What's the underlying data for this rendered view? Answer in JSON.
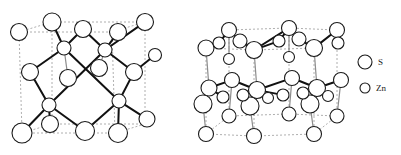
{
  "figure": {
    "background_color": "#ffffff",
    "width": 401,
    "height": 155
  },
  "style": {
    "atom_stroke": "#1a1a1a",
    "atom_fill": "#ffffff",
    "bond_color": "#111111",
    "cell_edge_color": "#9a9a9a",
    "bond_light_color": "#8d8d8d",
    "text_color": "#1a1a1a",
    "atom_stroke_width": 1.1,
    "bond_width": 2.0,
    "cell_dash": "2,2"
  },
  "structures": [
    {
      "name": "zinc-blende",
      "label": "",
      "lattice": "cubic",
      "cell_nodes": [
        {
          "id": "c-tfl",
          "x": 52,
          "y": 22
        },
        {
          "id": "c-tfr",
          "x": 145,
          "y": 22
        },
        {
          "id": "c-tbl",
          "x": 19,
          "y": 32
        },
        {
          "id": "c-tbr",
          "x": 112,
          "y": 32
        },
        {
          "id": "c-bfl",
          "x": 52,
          "y": 124
        },
        {
          "id": "c-bfr",
          "x": 145,
          "y": 124
        },
        {
          "id": "c-bbl",
          "x": 22,
          "y": 133
        },
        {
          "id": "c-bbr",
          "x": 115,
          "y": 133
        }
      ],
      "cell_edges": [
        [
          "c-tfl",
          "c-tfr"
        ],
        [
          "c-tfr",
          "c-tbr"
        ],
        [
          "c-tbr",
          "c-tbl"
        ],
        [
          "c-tbl",
          "c-tfl"
        ],
        [
          "c-bfl",
          "c-bfr"
        ],
        [
          "c-bfr",
          "c-bbr"
        ],
        [
          "c-bbr",
          "c-bbl"
        ],
        [
          "c-bbl",
          "c-bfl"
        ],
        [
          "c-tfl",
          "c-bfl"
        ],
        [
          "c-tfr",
          "c-bfr"
        ],
        [
          "c-tbl",
          "c-bbl"
        ],
        [
          "c-tbr",
          "c-bbr"
        ]
      ],
      "atoms": [
        {
          "id": "S1",
          "x": 19,
          "y": 32,
          "r": 8.5,
          "element": "S"
        },
        {
          "id": "S2",
          "x": 52,
          "y": 22,
          "r": 9.0,
          "element": "S"
        },
        {
          "id": "S3",
          "x": 145,
          "y": 22,
          "r": 8.5,
          "element": "S"
        },
        {
          "id": "S4",
          "x": 83,
          "y": 29,
          "r": 8.5,
          "element": "S"
        },
        {
          "id": "S5",
          "x": 118,
          "y": 32,
          "r": 8.5,
          "element": "S"
        },
        {
          "id": "S6",
          "x": 30,
          "y": 72,
          "r": 8.5,
          "element": "S"
        },
        {
          "id": "S7",
          "x": 68,
          "y": 78,
          "r": 8.5,
          "element": "S"
        },
        {
          "id": "S8",
          "x": 99,
          "y": 68,
          "r": 8.5,
          "element": "S"
        },
        {
          "id": "S9",
          "x": 134,
          "y": 72,
          "r": 8.5,
          "element": "S"
        },
        {
          "id": "S10",
          "x": 22,
          "y": 133,
          "r": 10.0,
          "element": "S"
        },
        {
          "id": "S11",
          "x": 50,
          "y": 124,
          "r": 8.5,
          "element": "S"
        },
        {
          "id": "S12",
          "x": 85,
          "y": 131,
          "r": 9.5,
          "element": "S"
        },
        {
          "id": "S13",
          "x": 118,
          "y": 133,
          "r": 9.5,
          "element": "S"
        },
        {
          "id": "S14",
          "x": 147,
          "y": 119,
          "r": 8.0,
          "element": "S"
        },
        {
          "id": "S15",
          "x": 155,
          "y": 55,
          "r": 6.5,
          "element": "S"
        },
        {
          "id": "Zn1",
          "x": 64,
          "y": 48,
          "r": 7.0,
          "element": "Zn"
        },
        {
          "id": "Zn2",
          "x": 105,
          "y": 50,
          "r": 7.0,
          "element": "Zn"
        },
        {
          "id": "Zn3",
          "x": 49,
          "y": 105,
          "r": 7.0,
          "element": "Zn"
        },
        {
          "id": "Zn4",
          "x": 119,
          "y": 101,
          "r": 7.0,
          "element": "Zn"
        }
      ],
      "bonds": [
        {
          "a": "Zn1",
          "b": "S2",
          "weight": "heavy"
        },
        {
          "a": "Zn1",
          "b": "S4",
          "weight": "heavy"
        },
        {
          "a": "Zn1",
          "b": "S6",
          "weight": "heavy"
        },
        {
          "a": "Zn1",
          "b": "Zn4",
          "weight": "heavy"
        },
        {
          "a": "Zn2",
          "b": "S4",
          "weight": "heavy"
        },
        {
          "a": "Zn2",
          "b": "S3",
          "weight": "heavy"
        },
        {
          "a": "Zn2",
          "b": "S9",
          "weight": "heavy"
        },
        {
          "a": "Zn2",
          "b": "Zn3",
          "weight": "heavy"
        },
        {
          "a": "Zn3",
          "b": "S6",
          "weight": "heavy"
        },
        {
          "a": "Zn3",
          "b": "S11",
          "weight": "heavy"
        },
        {
          "a": "Zn3",
          "b": "S10",
          "weight": "heavy"
        },
        {
          "a": "Zn3",
          "b": "S12",
          "weight": "heavy"
        },
        {
          "a": "Zn4",
          "b": "S9",
          "weight": "heavy"
        },
        {
          "a": "Zn4",
          "b": "S13",
          "weight": "heavy"
        },
        {
          "a": "Zn4",
          "b": "S12",
          "weight": "heavy"
        },
        {
          "a": "Zn4",
          "b": "S14",
          "weight": "heavy"
        },
        {
          "a": "S7",
          "b": "Zn1",
          "weight": "light"
        },
        {
          "a": "S8",
          "b": "Zn2",
          "weight": "light"
        },
        {
          "a": "S9",
          "b": "S15",
          "weight": "heavy"
        },
        {
          "a": "S5",
          "b": "Zn2",
          "weight": "heavy"
        }
      ]
    },
    {
      "name": "wurtzite",
      "label": "",
      "lattice": "hexagonal",
      "cell_nodes": [
        {
          "id": "h-t1",
          "x": 229,
          "y": 30
        },
        {
          "id": "h-t2",
          "x": 289,
          "y": 28
        },
        {
          "id": "h-t3",
          "x": 337,
          "y": 30
        },
        {
          "id": "h-t4",
          "x": 314,
          "y": 48
        },
        {
          "id": "h-t5",
          "x": 254,
          "y": 50
        },
        {
          "id": "h-t6",
          "x": 206,
          "y": 48
        },
        {
          "id": "h-b1",
          "x": 229,
          "y": 116
        },
        {
          "id": "h-b2",
          "x": 289,
          "y": 114
        },
        {
          "id": "h-b3",
          "x": 337,
          "y": 116
        },
        {
          "id": "h-b4",
          "x": 314,
          "y": 134
        },
        {
          "id": "h-b5",
          "x": 254,
          "y": 136
        },
        {
          "id": "h-b6",
          "x": 206,
          "y": 134
        }
      ],
      "cell_edges": [
        [
          "h-t1",
          "h-t2"
        ],
        [
          "h-t2",
          "h-t3"
        ],
        [
          "h-t3",
          "h-t4"
        ],
        [
          "h-t4",
          "h-t5"
        ],
        [
          "h-t5",
          "h-t6"
        ],
        [
          "h-t6",
          "h-t1"
        ],
        [
          "h-b1",
          "h-b2"
        ],
        [
          "h-b2",
          "h-b3"
        ],
        [
          "h-b3",
          "h-b4"
        ],
        [
          "h-b4",
          "h-b5"
        ],
        [
          "h-b5",
          "h-b6"
        ],
        [
          "h-b6",
          "h-b1"
        ],
        [
          "h-t1",
          "h-b1"
        ],
        [
          "h-t2",
          "h-b2"
        ],
        [
          "h-t3",
          "h-b3"
        ],
        [
          "h-t4",
          "h-b4"
        ],
        [
          "h-t5",
          "h-b5"
        ],
        [
          "h-t6",
          "h-b6"
        ]
      ],
      "atoms": [
        {
          "id": "WS1",
          "x": 229,
          "y": 30,
          "r": 7.5,
          "element": "S"
        },
        {
          "id": "WS2",
          "x": 289,
          "y": 28,
          "r": 7.5,
          "element": "S"
        },
        {
          "id": "WS3",
          "x": 337,
          "y": 30,
          "r": 7.5,
          "element": "S"
        },
        {
          "id": "WS4",
          "x": 206,
          "y": 48,
          "r": 8.0,
          "element": "S"
        },
        {
          "id": "WS5",
          "x": 254,
          "y": 50,
          "r": 8.5,
          "element": "S"
        },
        {
          "id": "WS6",
          "x": 314,
          "y": 48,
          "r": 8.5,
          "element": "S"
        },
        {
          "id": "WS7",
          "x": 240,
          "y": 41,
          "r": 7.0,
          "element": "S"
        },
        {
          "id": "WS8",
          "x": 299,
          "y": 39,
          "r": 7.0,
          "element": "S"
        },
        {
          "id": "WS9",
          "x": 219,
          "y": 43,
          "r": 6.0,
          "element": "S"
        },
        {
          "id": "WS10",
          "x": 279,
          "y": 41,
          "r": 6.0,
          "element": "S"
        },
        {
          "id": "WS11",
          "x": 338,
          "y": 43,
          "r": 6.0,
          "element": "S"
        },
        {
          "id": "WS12",
          "x": 209,
          "y": 88,
          "r": 8.0,
          "element": "S"
        },
        {
          "id": "WS13",
          "x": 257,
          "y": 90,
          "r": 8.5,
          "element": "S"
        },
        {
          "id": "WS14",
          "x": 317,
          "y": 88,
          "r": 8.5,
          "element": "S"
        },
        {
          "id": "WS15",
          "x": 232,
          "y": 80,
          "r": 7.5,
          "element": "S"
        },
        {
          "id": "WS16",
          "x": 292,
          "y": 78,
          "r": 7.5,
          "element": "S"
        },
        {
          "id": "WS17",
          "x": 341,
          "y": 80,
          "r": 7.5,
          "element": "S"
        },
        {
          "id": "WS18",
          "x": 203,
          "y": 104,
          "r": 9.0,
          "element": "S"
        },
        {
          "id": "WS19",
          "x": 250,
          "y": 106,
          "r": 9.0,
          "element": "S"
        },
        {
          "id": "WS20",
          "x": 310,
          "y": 104,
          "r": 9.0,
          "element": "S"
        },
        {
          "id": "WS21",
          "x": 229,
          "y": 116,
          "r": 7.0,
          "element": "S"
        },
        {
          "id": "WS22",
          "x": 289,
          "y": 114,
          "r": 7.0,
          "element": "S"
        },
        {
          "id": "WS23",
          "x": 337,
          "y": 116,
          "r": 7.0,
          "element": "S"
        },
        {
          "id": "WS24",
          "x": 206,
          "y": 134,
          "r": 7.5,
          "element": "S"
        },
        {
          "id": "WS25",
          "x": 254,
          "y": 136,
          "r": 7.5,
          "element": "S"
        },
        {
          "id": "WS26",
          "x": 314,
          "y": 134,
          "r": 7.5,
          "element": "S"
        },
        {
          "id": "WZ1",
          "x": 243,
          "y": 95,
          "r": 6.0,
          "element": "Zn"
        },
        {
          "id": "WZ2",
          "x": 303,
          "y": 93,
          "r": 6.0,
          "element": "Zn"
        },
        {
          "id": "WZ3",
          "x": 223,
          "y": 97,
          "r": 6.0,
          "element": "Zn"
        },
        {
          "id": "WZ4",
          "x": 283,
          "y": 95,
          "r": 6.0,
          "element": "Zn"
        },
        {
          "id": "WZ5",
          "x": 268,
          "y": 98,
          "r": 5.5,
          "element": "Zn"
        },
        {
          "id": "WZ6",
          "x": 328,
          "y": 96,
          "r": 5.5,
          "element": "Zn"
        },
        {
          "id": "WZ7",
          "x": 229,
          "y": 59,
          "r": 5.5,
          "element": "Zn"
        },
        {
          "id": "WZ8",
          "x": 289,
          "y": 57,
          "r": 5.5,
          "element": "Zn"
        }
      ],
      "bonds": [
        {
          "a": "WS1",
          "b": "WS7",
          "weight": "heavy"
        },
        {
          "a": "WS7",
          "b": "WS5",
          "weight": "heavy"
        },
        {
          "a": "WS5",
          "b": "WS2",
          "weight": "heavy"
        },
        {
          "a": "WS2",
          "b": "WS8",
          "weight": "heavy"
        },
        {
          "a": "WS8",
          "b": "WS6",
          "weight": "heavy"
        },
        {
          "a": "WS6",
          "b": "WS3",
          "weight": "heavy"
        },
        {
          "a": "WS4",
          "b": "WS9",
          "weight": "heavy"
        },
        {
          "a": "WS9",
          "b": "WS1",
          "weight": "heavy"
        },
        {
          "a": "WS5",
          "b": "WS10",
          "weight": "heavy"
        },
        {
          "a": "WS10",
          "b": "WS2",
          "weight": "heavy"
        },
        {
          "a": "WS12",
          "b": "WS15",
          "weight": "heavy"
        },
        {
          "a": "WS15",
          "b": "WS13",
          "weight": "heavy"
        },
        {
          "a": "WS13",
          "b": "WS16",
          "weight": "heavy"
        },
        {
          "a": "WS16",
          "b": "WS14",
          "weight": "heavy"
        },
        {
          "a": "WS14",
          "b": "WS17",
          "weight": "heavy"
        },
        {
          "a": "WS4",
          "b": "WS12",
          "weight": "light"
        },
        {
          "a": "WS5",
          "b": "WS13",
          "weight": "light"
        },
        {
          "a": "WS6",
          "b": "WS14",
          "weight": "light"
        },
        {
          "a": "WS1",
          "b": "WZ7",
          "weight": "light"
        },
        {
          "a": "WS2",
          "b": "WZ8",
          "weight": "light"
        },
        {
          "a": "WS18",
          "b": "WS24",
          "weight": "light"
        },
        {
          "a": "WS19",
          "b": "WS25",
          "weight": "light"
        },
        {
          "a": "WS20",
          "b": "WS26",
          "weight": "light"
        },
        {
          "a": "WS21",
          "b": "WS15",
          "weight": "light"
        },
        {
          "a": "WS22",
          "b": "WS16",
          "weight": "light"
        },
        {
          "a": "WS23",
          "b": "WS17",
          "weight": "light"
        },
        {
          "a": "WS13",
          "b": "WZ1",
          "weight": "heavy"
        },
        {
          "a": "WS13",
          "b": "WZ5",
          "weight": "heavy"
        },
        {
          "a": "WS14",
          "b": "WZ2",
          "weight": "heavy"
        },
        {
          "a": "WS14",
          "b": "WZ6",
          "weight": "heavy"
        },
        {
          "a": "WS12",
          "b": "WZ3",
          "weight": "heavy"
        },
        {
          "a": "WS13",
          "b": "WZ4",
          "weight": "heavy"
        },
        {
          "a": "WS18",
          "b": "WS12",
          "weight": "light"
        },
        {
          "a": "WS19",
          "b": "WS13",
          "weight": "light"
        },
        {
          "a": "WS20",
          "b": "WS14",
          "weight": "light"
        }
      ]
    }
  ],
  "legend": {
    "name": "element-legend",
    "items": [
      {
        "id": "legend-s",
        "label": "S",
        "radius": 7.0,
        "cx": 365,
        "cy": 62,
        "text_x": 378,
        "text_y": 65
      },
      {
        "id": "legend-zn",
        "label": "Zn",
        "radius": 5.0,
        "cx": 365,
        "cy": 88,
        "text_x": 376,
        "text_y": 91
      }
    ]
  }
}
